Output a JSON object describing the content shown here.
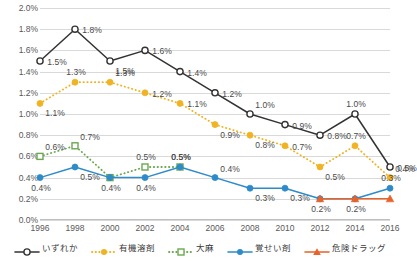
{
  "chart_data": {
    "type": "line",
    "title": "",
    "xlabel": "",
    "ylabel": "",
    "ylim": [
      0.0,
      2.0
    ],
    "ytick_step": 0.2,
    "grid": true,
    "legend_position": "bottom",
    "categories": [
      "1996",
      "1998",
      "2000",
      "2002",
      "2004",
      "2006",
      "2008",
      "2010",
      "2012",
      "2014",
      "2016"
    ],
    "ytick_labels": [
      "2.0%",
      "1.8%",
      "1.6%",
      "1.4%",
      "1.2%",
      "1.0%",
      "0.8%",
      "0.6%",
      "0.4%",
      "0.2%",
      "0.0%"
    ],
    "ytick_values": [
      2.0,
      1.8,
      1.6,
      1.4,
      1.2,
      1.0,
      0.8,
      0.6,
      0.4,
      0.2,
      0.0
    ],
    "series": [
      {
        "name": "いずれか",
        "color": "#333333",
        "marker": "open-circle",
        "dash": "solid",
        "values": [
          1.5,
          1.8,
          1.5,
          1.6,
          1.4,
          1.2,
          1.0,
          0.9,
          0.8,
          1.0,
          0.5
        ],
        "labels": [
          "1.5%",
          "1.8%",
          "1.5%",
          "1.6%",
          "1.4%",
          "1.2%",
          "1.0%",
          "0.9%",
          "0.8%",
          "1.0%",
          "0.5%"
        ],
        "label_pos": [
          "right",
          "right",
          "below-right",
          "right",
          "right",
          "right",
          "above-right",
          "right",
          "right",
          "above",
          "right"
        ]
      },
      {
        "name": "有機溶剤",
        "color": "#f0b323",
        "marker": "filled-circle",
        "dash": "dotted",
        "values": [
          1.1,
          1.3,
          1.3,
          1.2,
          1.1,
          0.9,
          0.8,
          0.7,
          0.5,
          0.7,
          0.4
        ],
        "labels": [
          "1.1%",
          "1.3%",
          "1.3%",
          "1.2%",
          "1.1%",
          "0.9%",
          "0.8%",
          "0.7%",
          "0.5%",
          "0.7%",
          "0.4%"
        ],
        "label_pos": [
          "below-right",
          "above",
          "above-right",
          "right",
          "right",
          "below-right",
          "below-right",
          "right",
          "below-right",
          "above",
          "above-right"
        ]
      },
      {
        "name": "大麻",
        "color": "#6aa84f",
        "marker": "open-square",
        "dash": "dotted",
        "values": [
          0.6,
          0.7,
          0.4,
          0.5,
          0.5,
          null,
          null,
          null,
          null,
          null,
          null
        ],
        "labels": [
          "0.6%",
          "0.7%",
          "",
          "0.5%",
          "0.5%",
          "",
          "",
          "",
          "",
          "",
          ""
        ],
        "label_pos": [
          "above-right",
          "above-right",
          "",
          "above",
          "above",
          "",
          "",
          "",
          "",
          "",
          ""
        ]
      },
      {
        "name": "覚せい剤",
        "color": "#2e8bc9",
        "marker": "filled-circle",
        "dash": "solid",
        "values": [
          0.4,
          0.5,
          0.4,
          0.4,
          0.5,
          0.4,
          0.3,
          0.3,
          0.2,
          0.2,
          0.3
        ],
        "labels": [
          "0.4%",
          "0.5%",
          "0.4%",
          "0.4%",
          "0.5%",
          "0.4%",
          "0.3%",
          "0.3%",
          "",
          "",
          "0.3%"
        ],
        "label_pos": [
          "below",
          "below-right",
          "below",
          "below",
          "above",
          "above-right",
          "below-right",
          "below-right",
          "",
          "",
          "above"
        ]
      },
      {
        "name": "危険ドラッグ",
        "color": "#e8622a",
        "marker": "triangle",
        "dash": "solid",
        "values": [
          null,
          null,
          null,
          null,
          null,
          null,
          null,
          null,
          0.2,
          0.2,
          0.2
        ],
        "labels": [
          "",
          "",
          "",
          "",
          "",
          "",
          "",
          "",
          "0.2%",
          "0.2%",
          ""
        ],
        "label_pos": [
          "",
          "",
          "",
          "",
          "",
          "",
          "",
          "",
          "below",
          "below",
          ""
        ]
      }
    ]
  },
  "legend": {
    "items": [
      {
        "label": "いずれか",
        "color": "#333333",
        "marker": "open-circle",
        "dash": "solid"
      },
      {
        "label": "有機溶剤",
        "color": "#f0b323",
        "marker": "filled-circle",
        "dash": "dotted"
      },
      {
        "label": "大麻",
        "color": "#6aa84f",
        "marker": "open-square",
        "dash": "dotted"
      },
      {
        "label": "覚せい剤",
        "color": "#2e8bc9",
        "marker": "filled-circle",
        "dash": "solid"
      },
      {
        "label": "危険ドラッグ",
        "color": "#e8622a",
        "marker": "triangle",
        "dash": "solid"
      }
    ]
  }
}
